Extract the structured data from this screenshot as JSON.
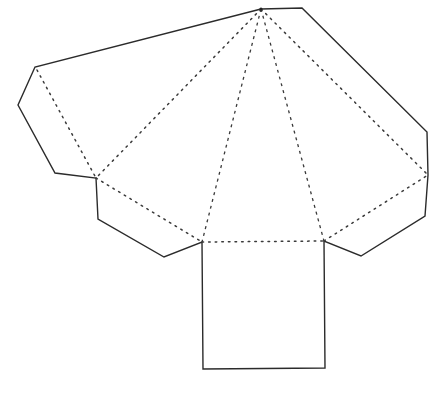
{
  "diagram": {
    "type": "net",
    "colors": {
      "background": "#ffffff",
      "cut_line": "#2b2b2b",
      "fold_line": "#3a3a3a"
    },
    "apex": [
      261,
      9
    ],
    "base_square": {
      "corners": [
        [
          202,
          242
        ],
        [
          324,
          241
        ],
        [
          325,
          368
        ],
        [
          203,
          369
        ]
      ]
    },
    "fold_points": {
      "left_outer": [
        96,
        178
      ],
      "base_left": [
        202,
        242
      ],
      "base_right": [
        324,
        241
      ],
      "right_outer": [
        428,
        175
      ],
      "flap_left_top": [
        37,
        70
      ]
    },
    "outline": [
      [
        261,
        9
      ],
      [
        302,
        8
      ],
      [
        427,
        132
      ],
      [
        428,
        175
      ],
      [
        425,
        216
      ],
      [
        361,
        256
      ],
      [
        324,
        241
      ],
      [
        325,
        368
      ],
      [
        203,
        369
      ],
      [
        202,
        242
      ],
      [
        164,
        257
      ],
      [
        98,
        219
      ],
      [
        96,
        178
      ],
      [
        55,
        173
      ],
      [
        18,
        105
      ],
      [
        35,
        67
      ],
      [
        261,
        9
      ]
    ],
    "fold_lines": [
      {
        "from": [
          261,
          9
        ],
        "to": [
          96,
          178
        ]
      },
      {
        "from": [
          261,
          9
        ],
        "to": [
          202,
          242
        ]
      },
      {
        "from": [
          261,
          9
        ],
        "to": [
          324,
          241
        ]
      },
      {
        "from": [
          261,
          9
        ],
        "to": [
          428,
          175
        ]
      },
      {
        "from": [
          96,
          178
        ],
        "to": [
          202,
          242
        ]
      },
      {
        "from": [
          202,
          242
        ],
        "to": [
          324,
          241
        ]
      },
      {
        "from": [
          324,
          241
        ],
        "to": [
          428,
          175
        ]
      },
      {
        "from": [
          37,
          70
        ],
        "to": [
          96,
          178
        ]
      }
    ],
    "faces": [
      "base",
      "triangle-left",
      "triangle-front-left",
      "triangle-front-right",
      "triangle-right",
      "glue-flap-left",
      "glue-flap-bottom-left",
      "glue-flap-bottom-right",
      "glue-flap-right"
    ]
  }
}
